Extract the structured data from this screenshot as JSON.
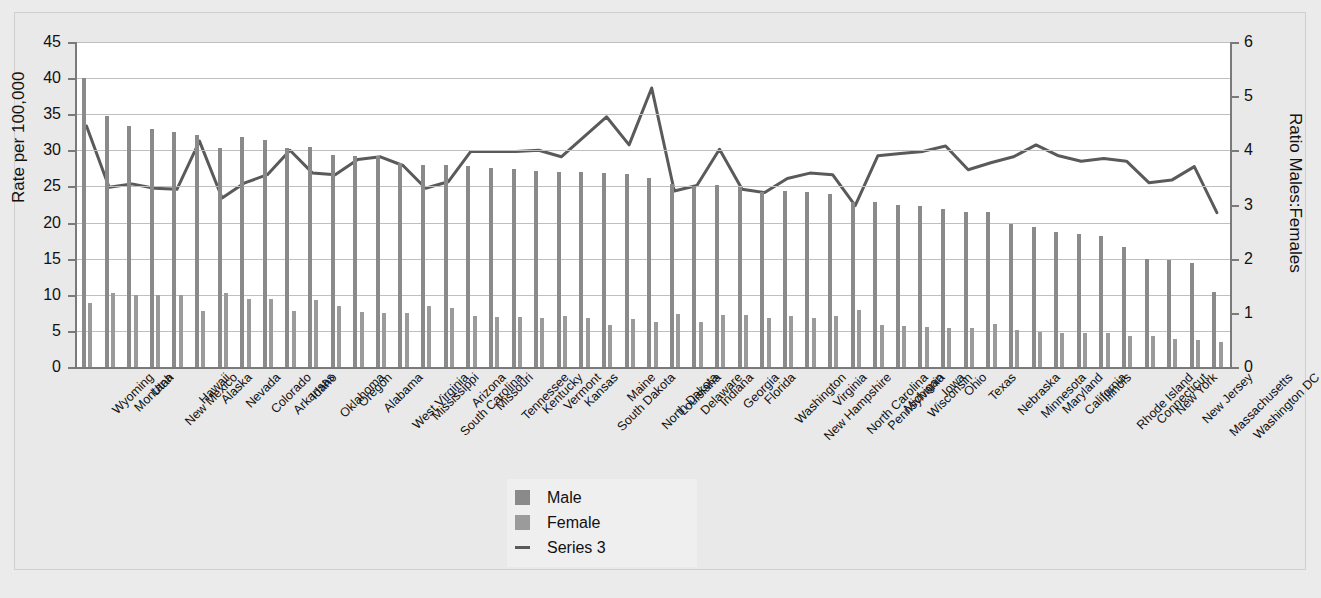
{
  "chart_data": {
    "type": "bar",
    "title": "",
    "xlabel": "",
    "ylabel": "Rate per 100,000",
    "y2label": "Ratio Males:Females",
    "ylim": [
      0,
      45
    ],
    "y2lim": [
      0,
      6
    ],
    "yticks": [
      0,
      5,
      10,
      15,
      20,
      25,
      30,
      35,
      40,
      45
    ],
    "y2ticks": [
      0,
      1,
      2,
      3,
      4,
      5,
      6
    ],
    "grid": true,
    "legend_position": "bottom-center",
    "categories": [
      "Wyoming",
      "Montana",
      "Utah",
      "New Mexico",
      "Hawaii",
      "Alaska",
      "Nevada",
      "Colorado",
      "Arkansas",
      "Idaho",
      "Oklahoma",
      "Oregon",
      "Alabama",
      "West Virginia",
      "Mississippi",
      "South Carolina",
      "Arizona",
      "Missouri",
      "Tennessee",
      "Kentucky",
      "Vermont",
      "Kansas",
      "South Dakota",
      "Maine",
      "North Dakota",
      "Louisiana",
      "Delaware",
      "Indiana",
      "Georgia",
      "Florida",
      "Washington",
      "New Hampshire",
      "Virginia",
      "North Carolina",
      "Pennsylvania",
      "Michigan",
      "Wisconsin",
      "Iowa",
      "Ohio",
      "Texas",
      "Nebraska",
      "Minnesota",
      "Maryland",
      "California",
      "Illinois",
      "Rhode Island",
      "Connecticut",
      "New York",
      "New Jersey",
      "Massachusetts",
      "Washington DC"
    ],
    "series": [
      {
        "name": "Male",
        "axis": "left",
        "color": "#8a8a8a",
        "values": [
          40.0,
          34.7,
          33.4,
          33.0,
          32.5,
          32.1,
          30.3,
          31.8,
          31.5,
          30.3,
          30.5,
          29.4,
          29.2,
          29.2,
          28.3,
          28.0,
          28.0,
          27.9,
          27.5,
          27.4,
          27.2,
          27.0,
          27.0,
          26.8,
          26.7,
          26.2,
          25.3,
          25.0,
          25.2,
          24.9,
          24.3,
          24.4,
          24.3,
          23.9,
          22.9,
          22.8,
          22.4,
          22.3,
          21.9,
          21.5,
          21.5,
          19.8,
          19.4,
          18.7,
          18.4,
          18.2,
          16.6,
          15.0,
          14.8,
          14.4,
          10.4
        ]
      },
      {
        "name": "Female",
        "axis": "left",
        "color": "#9b9b9b",
        "values": [
          8.8,
          10.3,
          10.0,
          10.0,
          10.0,
          7.7,
          10.3,
          9.4,
          9.4,
          7.7,
          9.3,
          8.4,
          7.6,
          7.5,
          7.5,
          8.4,
          8.2,
          7.0,
          6.9,
          6.9,
          6.8,
          7.0,
          6.8,
          5.8,
          6.7,
          6.3,
          7.4,
          6.3,
          7.2,
          7.2,
          6.8,
          7.0,
          6.8,
          7.0,
          7.9,
          5.8,
          5.7,
          5.6,
          5.4,
          5.4,
          6.0,
          5.1,
          4.8,
          4.7,
          4.7,
          4.7,
          4.3,
          4.3,
          3.9,
          3.7,
          3.5
        ]
      },
      {
        "name": "Series 3",
        "axis": "right",
        "color": "#5a5a5a",
        "values": [
          4.45,
          3.32,
          3.38,
          3.3,
          3.28,
          4.17,
          3.12,
          3.4,
          3.55,
          4.0,
          3.58,
          3.55,
          3.83,
          3.88,
          3.72,
          3.3,
          3.42,
          3.98,
          3.98,
          3.98,
          4.0,
          3.88,
          4.25,
          4.62,
          4.1,
          5.15,
          3.25,
          3.35,
          4.02,
          3.28,
          3.22,
          3.48,
          3.58,
          3.55,
          2.98,
          3.9,
          3.94,
          3.98,
          4.08,
          3.64,
          3.77,
          3.88,
          4.1,
          3.9,
          3.8,
          3.85,
          3.8,
          3.4,
          3.45,
          3.7,
          2.85
        ]
      }
    ]
  },
  "legend": {
    "items": [
      {
        "label": "Male",
        "marker": "square"
      },
      {
        "label": "Female",
        "marker": "square"
      },
      {
        "label": "Series 3",
        "marker": "line"
      }
    ]
  },
  "colors": {
    "background": "#ebebeb",
    "plot_background": "#ffffff",
    "male": "#8a8a8a",
    "female": "#9b9b9b",
    "line": "#5a5a5a",
    "grid": "#bfbfbf",
    "axis": "#7a7a7a"
  }
}
